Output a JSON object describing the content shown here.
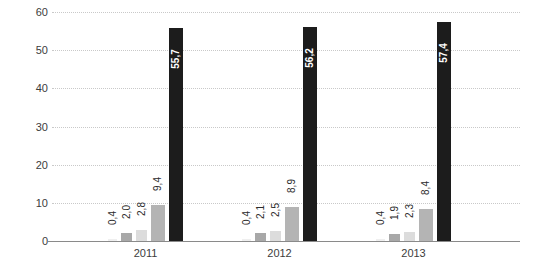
{
  "chart_data": {
    "type": "bar",
    "title": "",
    "subtitle": "",
    "xlabel": "",
    "ylabel": "",
    "categories": [
      "2011",
      "2012",
      "2013"
    ],
    "ylim": [
      0,
      60
    ],
    "ytick_labels": [
      "0",
      "10",
      "20",
      "30",
      "40",
      "50",
      "60"
    ],
    "ytick_values": [
      0,
      10,
      20,
      30,
      40,
      50,
      60
    ],
    "grid": true,
    "grid_style": "dotted-horizontal",
    "legend": "none",
    "decimal_separator": ",",
    "series": [
      {
        "name": "series-1",
        "color": "#efefef",
        "values": [
          0.4,
          0.4,
          0.4
        ],
        "labels": [
          "0,4",
          "0,4",
          "0,4"
        ]
      },
      {
        "name": "series-2",
        "color": "#a8a8a8",
        "values": [
          2.0,
          2.1,
          1.9
        ],
        "labels": [
          "2,0",
          "2,1",
          "1,9"
        ]
      },
      {
        "name": "series-3",
        "color": "#dcdcdc",
        "values": [
          2.8,
          2.5,
          2.3
        ],
        "labels": [
          "2,8",
          "2,5",
          "2,3"
        ]
      },
      {
        "name": "series-4",
        "color": "#b4b4b4",
        "values": [
          9.4,
          8.9,
          8.4
        ],
        "labels": [
          "9,4",
          "8,9",
          "8,4"
        ]
      },
      {
        "name": "series-5",
        "color": "#1c1c1c",
        "values": [
          55.7,
          56.2,
          57.4
        ],
        "labels": [
          "55,7",
          "56,2",
          "57,4"
        ]
      }
    ]
  },
  "axis": {
    "y_labels": [
      "60",
      "50",
      "40",
      "30",
      "20",
      "10",
      "0"
    ],
    "x_labels": [
      "2011",
      "2012",
      "2013"
    ]
  },
  "colors": {
    "background": "#ffffff",
    "gridline": "#c9c9c9",
    "baseline": "#8a8a8a",
    "text": "#3c3c3c",
    "label_on_dark": "#ffffff"
  }
}
